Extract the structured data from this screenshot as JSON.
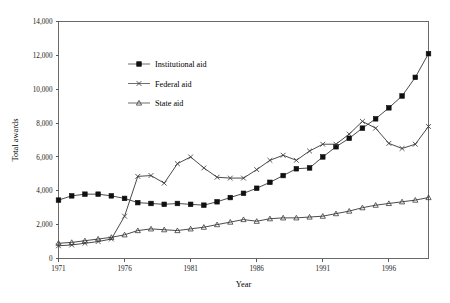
{
  "chart_data": {
    "type": "line",
    "title": "",
    "xlabel": "Year",
    "ylabel": "Total awards",
    "xlim": [
      1971,
      1999
    ],
    "ylim": [
      0,
      14000
    ],
    "grid": false,
    "legend_position": "inside-upper-left",
    "x": [
      1971,
      1972,
      1973,
      1974,
      1975,
      1976,
      1977,
      1978,
      1979,
      1980,
      1981,
      1982,
      1983,
      1984,
      1985,
      1986,
      1987,
      1988,
      1989,
      1990,
      1991,
      1992,
      1993,
      1994,
      1995,
      1996,
      1997,
      1998,
      1999
    ],
    "xtick_labels": [
      "1971",
      "1976",
      "1981",
      "1986",
      "1991",
      "1996"
    ],
    "xtick_values": [
      1971,
      1976,
      1981,
      1986,
      1991,
      1996
    ],
    "ytick_labels": [
      "0",
      "2,000",
      "4,000",
      "6,000",
      "8,000",
      "10,000",
      "12,000",
      "14,000"
    ],
    "ytick_values": [
      0,
      2000,
      4000,
      6000,
      8000,
      10000,
      12000,
      14000
    ],
    "series": [
      {
        "name": "Institutional aid",
        "marker": "filled-square",
        "values": [
          3450,
          3700,
          3800,
          3800,
          3700,
          3550,
          3300,
          3250,
          3200,
          3250,
          3200,
          3150,
          3350,
          3600,
          3850,
          4150,
          4500,
          4900,
          5300,
          5350,
          6000,
          6600,
          7100,
          7700,
          8250,
          8900,
          9600,
          10700,
          12100
        ]
      },
      {
        "name": "Federal aid",
        "marker": "cross",
        "values": [
          750,
          800,
          900,
          1000,
          1150,
          2500,
          4850,
          4900,
          4450,
          5600,
          6000,
          5350,
          4800,
          4750,
          4750,
          5250,
          5800,
          6100,
          5800,
          6350,
          6750,
          6750,
          7350,
          8100,
          7700,
          6800,
          6500,
          6750,
          7800
        ]
      },
      {
        "name": "State aid",
        "marker": "triangle",
        "values": [
          900,
          950,
          1050,
          1150,
          1250,
          1400,
          1650,
          1750,
          1700,
          1650,
          1750,
          1850,
          2000,
          2150,
          2300,
          2200,
          2350,
          2400,
          2400,
          2450,
          2500,
          2650,
          2800,
          3000,
          3150,
          3250,
          3350,
          3450,
          3600
        ]
      }
    ]
  },
  "legend": {
    "items": [
      {
        "label": "Institutional aid"
      },
      {
        "label": "Federal aid"
      },
      {
        "label": "State aid"
      }
    ]
  }
}
